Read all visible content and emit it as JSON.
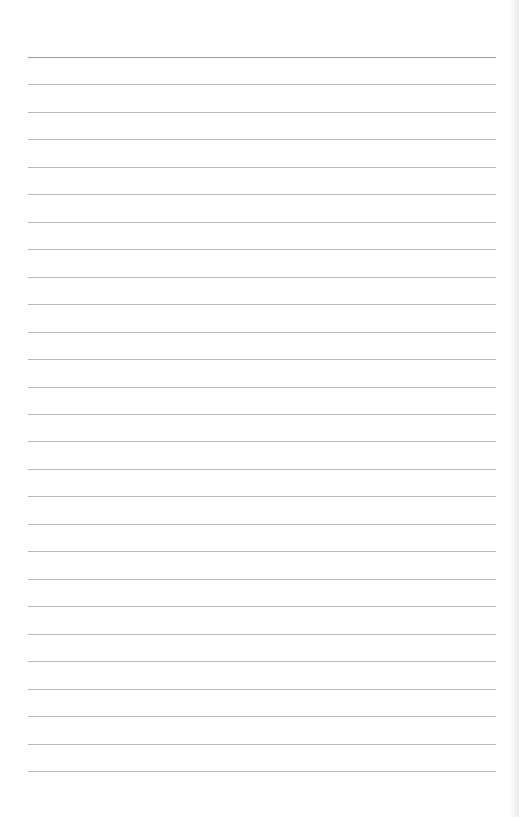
{
  "page": {
    "type": "lined-paper",
    "line_count": 27,
    "line_color": "#b9b9b9",
    "top_line_color": "#9a9a9a",
    "background_color": "#ffffff",
    "text": ""
  }
}
